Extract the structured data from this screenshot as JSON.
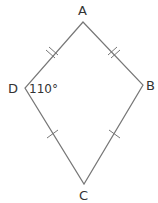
{
  "diagram": {
    "type": "kite",
    "vertices": [
      {
        "id": "A",
        "label": "A"
      },
      {
        "id": "B",
        "label": "B"
      },
      {
        "id": "C",
        "label": "C"
      },
      {
        "id": "D",
        "label": "D"
      }
    ],
    "angle_label": "110°",
    "angle_at": "D",
    "tick_marks": {
      "AD": 2,
      "AB": 2,
      "DC": 1,
      "BC": 1
    },
    "colors": {
      "stroke": "#777777",
      "text": "#333333"
    }
  }
}
